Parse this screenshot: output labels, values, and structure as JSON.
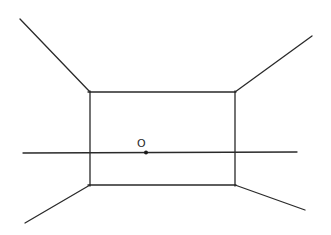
{
  "diagram": {
    "type": "one-point perspective sketch (room box)",
    "point_label": "O",
    "colors": {
      "stroke": "#2a2a2a",
      "background": "#ffffff"
    },
    "geometry": {
      "back_wall": {
        "x1": 90,
        "y1": 92,
        "x2": 235,
        "y2": 185
      },
      "horizon": {
        "x1": 23,
        "y1": 153,
        "x2": 297,
        "y2": 152
      },
      "vanishing_point": {
        "x": 146,
        "y": 152
      },
      "label_pos": {
        "x": 140,
        "y": 146
      },
      "diagonals": [
        {
          "name": "top-left",
          "x1": 20,
          "y1": 19,
          "x2": 90,
          "y2": 92
        },
        {
          "name": "top-right",
          "x1": 312,
          "y1": 36,
          "x2": 235,
          "y2": 92
        },
        {
          "name": "bottom-left",
          "x1": 25,
          "y1": 223,
          "x2": 90,
          "y2": 185
        },
        {
          "name": "bottom-right",
          "x1": 305,
          "y1": 210,
          "x2": 235,
          "y2": 185
        }
      ]
    }
  }
}
